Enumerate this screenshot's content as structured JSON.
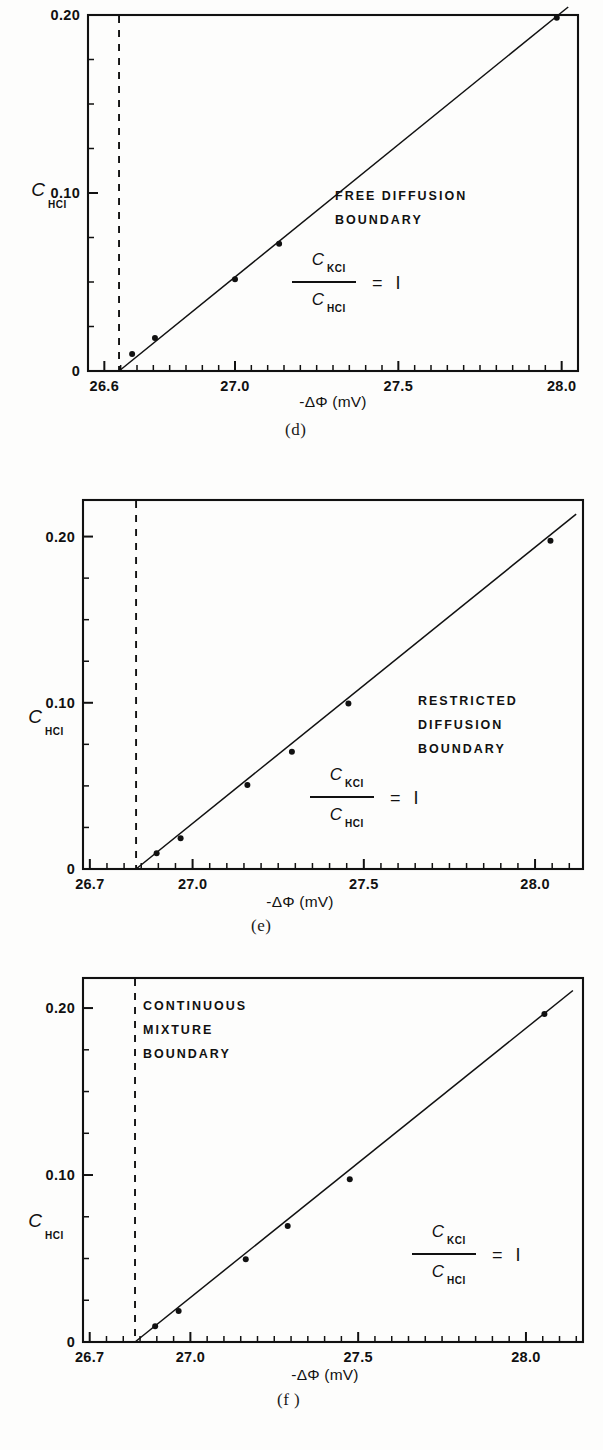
{
  "figure": {
    "background_color": "#fdfdfc",
    "ink_color": "#111111"
  },
  "panels": [
    {
      "id": "d",
      "caption": "(d)",
      "annotation_lines": [
        "FREE  DIFFUSION",
        "BOUNDARY"
      ],
      "ratio_numerator": "C",
      "ratio_numerator_sub": "KCI",
      "ratio_denominator": "C",
      "ratio_denominator_sub": "HCI",
      "ratio_equals": "= I",
      "xlabel": "-ΔΦ (mV)",
      "ylabel": "C",
      "ylabel_sub": "HCI",
      "xticks": [
        "26.6",
        "27.0",
        "27.5",
        "28.0"
      ],
      "xtick_values": [
        26.6,
        27.0,
        27.5,
        28.0
      ],
      "yticks": [
        "0",
        "0.10",
        "0.20"
      ],
      "ytick_values": [
        0,
        0.1,
        0.2
      ],
      "dashed_line_x": 26.645,
      "chart_data": {
        "type": "scatter",
        "title": "FREE DIFFUSION BOUNDARY",
        "xlabel": "-ΔΦ (mV)",
        "ylabel": "C_HCl",
        "xlim": [
          26.55,
          28.05
        ],
        "ylim": [
          0,
          0.2
        ],
        "grid": false,
        "legend": "none",
        "series": [
          {
            "name": "C_KCl/C_HCl = 1",
            "x": [
              26.685,
              26.755,
              27.0,
              27.135,
              27.985
            ],
            "y": [
              0.0095,
              0.0185,
              0.0515,
              0.0715,
              0.1985
            ]
          }
        ],
        "fit_line": {
          "x": [
            26.645,
            28.02
          ],
          "y": [
            0.0,
            0.2045
          ]
        }
      }
    },
    {
      "id": "e",
      "caption": "(e)",
      "annotation_lines": [
        "RESTRICTED",
        "DIFFUSION",
        "BOUNDARY"
      ],
      "ratio_numerator": "C",
      "ratio_numerator_sub": "KCI",
      "ratio_denominator": "C",
      "ratio_denominator_sub": "HCI",
      "ratio_equals": "= I",
      "xlabel": "-ΔΦ (mV)",
      "ylabel": "C",
      "ylabel_sub": "HCI",
      "xticks": [
        "26.7",
        "27.0",
        "27.5",
        "28.0"
      ],
      "xtick_values": [
        26.7,
        27.0,
        27.5,
        28.0
      ],
      "yticks": [
        "0",
        "0.10",
        "0.20"
      ],
      "ytick_values": [
        0,
        0.1,
        0.2
      ],
      "dashed_line_x": 26.835,
      "chart_data": {
        "type": "scatter",
        "title": "RESTRICTED DIFFUSION BOUNDARY",
        "xlabel": "-ΔΦ (mV)",
        "ylabel": "C_HCl",
        "xlim": [
          26.68,
          28.14
        ],
        "ylim": [
          0,
          0.222
        ],
        "grid": false,
        "legend": "none",
        "series": [
          {
            "name": "C_KCl/C_HCl = 1",
            "x": [
              26.895,
              26.965,
              27.16,
              27.29,
              27.455,
              28.045
            ],
            "y": [
              0.0095,
              0.0185,
              0.0505,
              0.0705,
              0.0995,
              0.1975
            ]
          }
        ],
        "fit_line": {
          "x": [
            26.835,
            28.12
          ],
          "y": [
            0.0,
            0.2135
          ]
        }
      }
    },
    {
      "id": "f",
      "caption": "(f )",
      "annotation_lines": [
        "CONTINUOUS",
        "MIXTURE",
        "BOUNDARY"
      ],
      "ratio_numerator": "C",
      "ratio_numerator_sub": "KCI",
      "ratio_denominator": "C",
      "ratio_denominator_sub": "HCI",
      "ratio_equals": "= I",
      "xlabel": "-ΔΦ (mV)",
      "ylabel": "C",
      "ylabel_sub": "HCI",
      "xticks": [
        "26.7",
        "27.0",
        "27.5",
        "28.0"
      ],
      "xtick_values": [
        26.7,
        27.0,
        27.5,
        28.0
      ],
      "yticks": [
        "0",
        "0.10",
        "0.20"
      ],
      "ytick_values": [
        0,
        0.1,
        0.2
      ],
      "dashed_line_x": 26.835,
      "chart_data": {
        "type": "scatter",
        "title": "CONTINUOUS MIXTURE BOUNDARY",
        "xlabel": "-ΔΦ (mV)",
        "ylabel": "C_HCl",
        "xlim": [
          26.68,
          28.17
        ],
        "ylim": [
          0,
          0.218
        ],
        "grid": false,
        "legend": "none",
        "series": [
          {
            "name": "C_KCl/C_HCl = 1",
            "x": [
              26.895,
              26.965,
              27.165,
              27.29,
              27.475,
              28.055
            ],
            "y": [
              0.0095,
              0.0185,
              0.0495,
              0.0695,
              0.0975,
              0.1965
            ]
          }
        ],
        "fit_line": {
          "x": [
            26.835,
            28.14
          ],
          "y": [
            0.0,
            0.2105
          ]
        }
      }
    }
  ]
}
